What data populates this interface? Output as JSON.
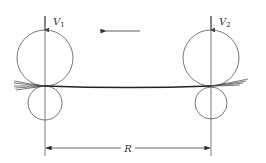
{
  "diagram": {
    "type": "two-stand rolling mill schematic",
    "direction_arrow": "left",
    "stands": [
      {
        "id": "stand-1",
        "velocity_label": "V",
        "velocity_subscript": "1"
      },
      {
        "id": "stand-2",
        "velocity_label": "V",
        "velocity_subscript": "2"
      }
    ],
    "dimension": {
      "label": "R"
    }
  },
  "colors": {
    "line": "#555555",
    "strip": "#222222",
    "text": "#333333",
    "background": "#ffffff"
  }
}
